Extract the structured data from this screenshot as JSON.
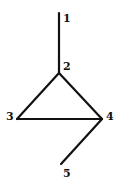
{
  "diagram": {
    "type": "graph",
    "nodes": [
      {
        "id": "1",
        "label": "1",
        "x": 59,
        "y": 13,
        "lx": 63,
        "ly": 22
      },
      {
        "id": "2",
        "label": "2",
        "x": 59,
        "y": 73,
        "lx": 63,
        "ly": 70
      },
      {
        "id": "3",
        "label": "3",
        "x": 17,
        "y": 119,
        "lx": 6,
        "ly": 120
      },
      {
        "id": "4",
        "label": "4",
        "x": 102,
        "y": 119,
        "lx": 106,
        "ly": 120
      },
      {
        "id": "5",
        "label": "5",
        "x": 61,
        "y": 164,
        "lx": 63,
        "ly": 177
      }
    ],
    "edges": [
      {
        "from": "1",
        "to": "2"
      },
      {
        "from": "2",
        "to": "3"
      },
      {
        "from": "2",
        "to": "4"
      },
      {
        "from": "3",
        "to": "4"
      },
      {
        "from": "4",
        "to": "5"
      }
    ],
    "colors": {
      "stroke": "#111111",
      "background": "#ffffff"
    }
  }
}
